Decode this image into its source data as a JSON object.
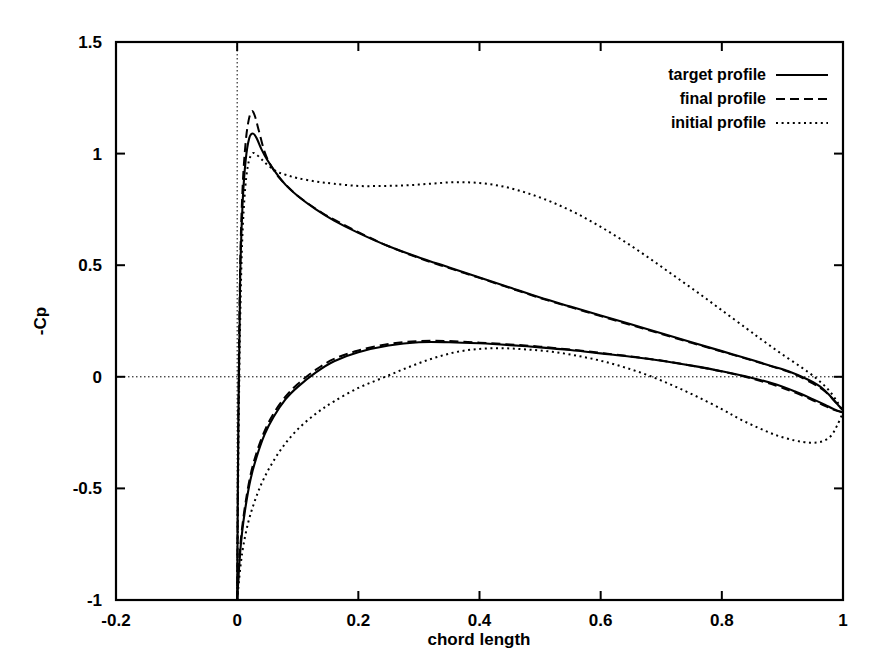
{
  "chart_data": {
    "type": "line",
    "title": "",
    "xlabel": "chord length",
    "ylabel": "-Cp",
    "xlim": [
      -0.2,
      1.0
    ],
    "ylim": [
      -1.0,
      1.5
    ],
    "xticks": [
      "-0.2",
      "0",
      "0.2",
      "0.4",
      "0.6",
      "0.8",
      "1"
    ],
    "xtick_values": [
      -0.2,
      0,
      0.2,
      0.4,
      0.6,
      0.8,
      1
    ],
    "yticks": [
      "1.5",
      "1",
      "0.5",
      "0",
      "-0.5",
      "-1"
    ],
    "ytick_values": [
      1.5,
      1,
      0.5,
      0,
      -0.5,
      -1
    ],
    "grid": "zero-lines-only",
    "legend_position": "top-right-inside",
    "legend": [
      {
        "label": "target profile",
        "style": "solid"
      },
      {
        "label": "final profile",
        "style": "dashed"
      },
      {
        "label": "initial profile",
        "style": "dotted"
      }
    ],
    "series": [
      {
        "name": "target profile",
        "style": "solid",
        "branches": [
          {
            "name": "suction-side",
            "points": [
              [
                0.0,
                -1.0
              ],
              [
                0.002,
                -0.2
              ],
              [
                0.005,
                0.45
              ],
              [
                0.009,
                0.78
              ],
              [
                0.014,
                0.97
              ],
              [
                0.02,
                1.07
              ],
              [
                0.026,
                1.09
              ],
              [
                0.032,
                1.07
              ],
              [
                0.04,
                1.02
              ],
              [
                0.05,
                0.97
              ],
              [
                0.065,
                0.91
              ],
              [
                0.08,
                0.86
              ],
              [
                0.1,
                0.81
              ],
              [
                0.13,
                0.75
              ],
              [
                0.16,
                0.7
              ],
              [
                0.2,
                0.645
              ],
              [
                0.25,
                0.585
              ],
              [
                0.3,
                0.535
              ],
              [
                0.35,
                0.49
              ],
              [
                0.4,
                0.445
              ],
              [
                0.45,
                0.4
              ],
              [
                0.5,
                0.355
              ],
              [
                0.55,
                0.315
              ],
              [
                0.6,
                0.275
              ],
              [
                0.65,
                0.235
              ],
              [
                0.7,
                0.195
              ],
              [
                0.75,
                0.155
              ],
              [
                0.8,
                0.115
              ],
              [
                0.85,
                0.075
              ],
              [
                0.88,
                0.05
              ],
              [
                0.91,
                0.025
              ],
              [
                0.94,
                -0.01
              ],
              [
                0.96,
                -0.04
              ],
              [
                0.975,
                -0.075
              ],
              [
                0.985,
                -0.105
              ],
              [
                0.993,
                -0.13
              ],
              [
                1.0,
                -0.15
              ]
            ]
          },
          {
            "name": "pressure-side",
            "points": [
              [
                0.0,
                -1.0
              ],
              [
                0.004,
                -0.82
              ],
              [
                0.008,
                -0.7
              ],
              [
                0.014,
                -0.58
              ],
              [
                0.022,
                -0.46
              ],
              [
                0.032,
                -0.36
              ],
              [
                0.045,
                -0.26
              ],
              [
                0.06,
                -0.18
              ],
              [
                0.08,
                -0.1
              ],
              [
                0.1,
                -0.045
              ],
              [
                0.13,
                0.02
              ],
              [
                0.16,
                0.07
              ],
              [
                0.2,
                0.11
              ],
              [
                0.25,
                0.14
              ],
              [
                0.3,
                0.155
              ],
              [
                0.35,
                0.155
              ],
              [
                0.4,
                0.15
              ],
              [
                0.45,
                0.142
              ],
              [
                0.5,
                0.132
              ],
              [
                0.55,
                0.12
              ],
              [
                0.6,
                0.105
              ],
              [
                0.65,
                0.09
              ],
              [
                0.7,
                0.072
              ],
              [
                0.75,
                0.05
              ],
              [
                0.8,
                0.025
              ],
              [
                0.85,
                -0.005
              ],
              [
                0.89,
                -0.035
              ],
              [
                0.92,
                -0.065
              ],
              [
                0.95,
                -0.1
              ],
              [
                0.97,
                -0.125
              ],
              [
                0.985,
                -0.145
              ],
              [
                1.0,
                -0.16
              ]
            ]
          }
        ]
      },
      {
        "name": "final profile",
        "style": "dashed",
        "branches": [
          {
            "name": "suction-side",
            "points": [
              [
                0.0,
                -1.0
              ],
              [
                0.002,
                -0.15
              ],
              [
                0.005,
                0.5
              ],
              [
                0.009,
                0.85
              ],
              [
                0.014,
                1.05
              ],
              [
                0.019,
                1.15
              ],
              [
                0.024,
                1.19
              ],
              [
                0.029,
                1.17
              ],
              [
                0.036,
                1.1
              ],
              [
                0.045,
                1.01
              ],
              [
                0.055,
                0.95
              ],
              [
                0.07,
                0.89
              ],
              [
                0.09,
                0.835
              ],
              [
                0.11,
                0.79
              ],
              [
                0.14,
                0.735
              ],
              [
                0.17,
                0.69
              ],
              [
                0.21,
                0.635
              ],
              [
                0.25,
                0.585
              ],
              [
                0.3,
                0.532
              ],
              [
                0.35,
                0.487
              ],
              [
                0.4,
                0.443
              ],
              [
                0.45,
                0.398
              ],
              [
                0.5,
                0.353
              ],
              [
                0.55,
                0.312
              ],
              [
                0.6,
                0.272
              ],
              [
                0.65,
                0.232
              ],
              [
                0.7,
                0.192
              ],
              [
                0.75,
                0.152
              ],
              [
                0.8,
                0.113
              ],
              [
                0.85,
                0.073
              ],
              [
                0.89,
                0.04
              ],
              [
                0.92,
                0.012
              ],
              [
                0.95,
                -0.03
              ],
              [
                0.97,
                -0.065
              ],
              [
                0.985,
                -0.105
              ],
              [
                1.0,
                -0.15
              ]
            ]
          },
          {
            "name": "pressure-side",
            "points": [
              [
                0.0,
                -1.0
              ],
              [
                0.004,
                -0.8
              ],
              [
                0.008,
                -0.68
              ],
              [
                0.014,
                -0.56
              ],
              [
                0.022,
                -0.44
              ],
              [
                0.032,
                -0.34
              ],
              [
                0.045,
                -0.245
              ],
              [
                0.06,
                -0.165
              ],
              [
                0.08,
                -0.088
              ],
              [
                0.1,
                -0.032
              ],
              [
                0.13,
                0.032
              ],
              [
                0.16,
                0.08
              ],
              [
                0.2,
                0.118
              ],
              [
                0.25,
                0.147
              ],
              [
                0.3,
                0.16
              ],
              [
                0.35,
                0.16
              ],
              [
                0.4,
                0.153
              ],
              [
                0.45,
                0.145
              ],
              [
                0.5,
                0.135
              ],
              [
                0.55,
                0.122
              ],
              [
                0.6,
                0.107
              ],
              [
                0.65,
                0.091
              ],
              [
                0.7,
                0.073
              ],
              [
                0.75,
                0.05
              ],
              [
                0.8,
                0.024
              ],
              [
                0.85,
                -0.008
              ],
              [
                0.89,
                -0.04
              ],
              [
                0.92,
                -0.07
              ],
              [
                0.95,
                -0.105
              ],
              [
                0.97,
                -0.13
              ],
              [
                0.985,
                -0.148
              ],
              [
                1.0,
                -0.16
              ]
            ]
          }
        ]
      },
      {
        "name": "initial profile",
        "style": "dotted",
        "branches": [
          {
            "name": "suction-side",
            "points": [
              [
                0.0,
                -1.0
              ],
              [
                0.003,
                -0.1
              ],
              [
                0.007,
                0.5
              ],
              [
                0.012,
                0.8
              ],
              [
                0.018,
                0.95
              ],
              [
                0.025,
                1.0
              ],
              [
                0.032,
                0.995
              ],
              [
                0.04,
                0.975
              ],
              [
                0.05,
                0.95
              ],
              [
                0.065,
                0.92
              ],
              [
                0.08,
                0.905
              ],
              [
                0.1,
                0.89
              ],
              [
                0.13,
                0.875
              ],
              [
                0.16,
                0.865
              ],
              [
                0.2,
                0.855
              ],
              [
                0.24,
                0.855
              ],
              [
                0.28,
                0.858
              ],
              [
                0.32,
                0.865
              ],
              [
                0.36,
                0.872
              ],
              [
                0.4,
                0.868
              ],
              [
                0.44,
                0.852
              ],
              [
                0.48,
                0.822
              ],
              [
                0.52,
                0.782
              ],
              [
                0.56,
                0.732
              ],
              [
                0.6,
                0.672
              ],
              [
                0.64,
                0.605
              ],
              [
                0.68,
                0.532
              ],
              [
                0.72,
                0.455
              ],
              [
                0.76,
                0.378
              ],
              [
                0.8,
                0.298
              ],
              [
                0.84,
                0.218
              ],
              [
                0.87,
                0.158
              ],
              [
                0.9,
                0.1
              ],
              [
                0.93,
                0.045
              ],
              [
                0.955,
                -0.005
              ],
              [
                0.975,
                -0.055
              ],
              [
                0.99,
                -0.11
              ],
              [
                1.0,
                -0.16
              ]
            ]
          },
          {
            "name": "pressure-side",
            "points": [
              [
                0.0,
                -1.0
              ],
              [
                0.005,
                -0.86
              ],
              [
                0.01,
                -0.76
              ],
              [
                0.018,
                -0.655
              ],
              [
                0.028,
                -0.565
              ],
              [
                0.04,
                -0.48
              ],
              [
                0.055,
                -0.4
              ],
              [
                0.075,
                -0.315
              ],
              [
                0.1,
                -0.235
              ],
              [
                0.13,
                -0.165
              ],
              [
                0.16,
                -0.11
              ],
              [
                0.2,
                -0.05
              ],
              [
                0.24,
                -0.005
              ],
              [
                0.28,
                0.04
              ],
              [
                0.32,
                0.08
              ],
              [
                0.36,
                0.11
              ],
              [
                0.4,
                0.125
              ],
              [
                0.44,
                0.128
              ],
              [
                0.48,
                0.122
              ],
              [
                0.52,
                0.112
              ],
              [
                0.56,
                0.095
              ],
              [
                0.6,
                0.072
              ],
              [
                0.64,
                0.042
              ],
              [
                0.68,
                0.005
              ],
              [
                0.72,
                -0.04
              ],
              [
                0.76,
                -0.09
              ],
              [
                0.8,
                -0.145
              ],
              [
                0.83,
                -0.19
              ],
              [
                0.86,
                -0.228
              ],
              [
                0.89,
                -0.262
              ],
              [
                0.92,
                -0.285
              ],
              [
                0.945,
                -0.295
              ],
              [
                0.965,
                -0.29
              ],
              [
                0.98,
                -0.265
              ],
              [
                0.99,
                -0.22
              ],
              [
                1.0,
                -0.16
              ]
            ]
          }
        ]
      }
    ]
  }
}
